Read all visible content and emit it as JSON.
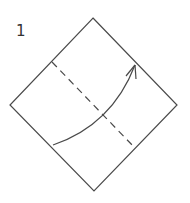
{
  "diagram": {
    "step_number": "1",
    "colors": {
      "line": "#4a4a4a",
      "background": "#ffffff"
    },
    "shapes": {
      "square_paper": {
        "points": "93,18 177,105 94,191 10,105"
      },
      "valley_fold_line": {
        "x1": 52,
        "y1": 62,
        "x2": 135,
        "y2": 148
      },
      "fold_arrow": {
        "path": "M53,145 Q112,125 135,65"
      }
    }
  }
}
